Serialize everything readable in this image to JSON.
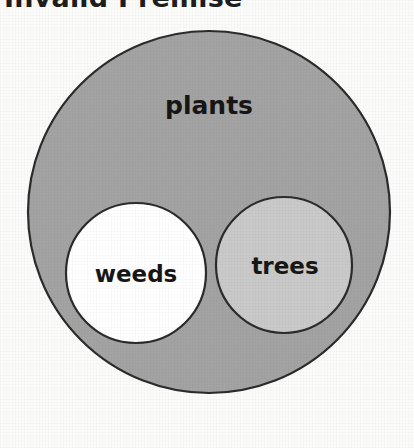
{
  "title": {
    "text": "Invalid Premise",
    "clipped_at_top": true
  },
  "diagram": {
    "type": "euler-venn",
    "sets": [
      {
        "id": "plants",
        "label": "plants",
        "role": "outer-containing-set",
        "fill": "#a3a3a3",
        "stroke": "#2b2b2b",
        "cx": 209,
        "cy": 212,
        "r": 181,
        "label_x": 209,
        "label_y": 107
      },
      {
        "id": "weeds",
        "label": "weeds",
        "role": "inner-subset-left",
        "fill": "#ffffff",
        "stroke": "#2b2b2b",
        "cx": 136,
        "cy": 273,
        "r": 70,
        "label_x": 136,
        "label_y": 275
      },
      {
        "id": "trees",
        "label": "trees",
        "role": "inner-subset-right",
        "fill": "#c9c9c9",
        "stroke": "#2b2b2b",
        "cx": 284,
        "cy": 265,
        "r": 68,
        "label_x": 285,
        "label_y": 267
      }
    ],
    "background": "#fbfbfa"
  }
}
